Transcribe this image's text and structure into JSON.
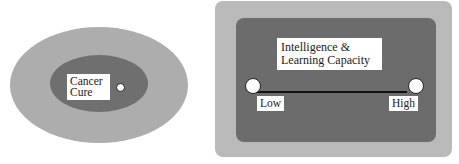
{
  "left_diagram": {
    "label": "Cancer Cure",
    "label_lines": [
      "Cancer",
      "Cure"
    ]
  },
  "right_diagram": {
    "title_lines": [
      "Intelligence &",
      "Learning Capacity"
    ],
    "scale": {
      "low_label": "Low",
      "high_label": "High"
    }
  },
  "colors": {
    "outer_light_gray": "#adadad",
    "inner_dark_gray": "#6f6f6f",
    "rect_outer": "#b9b9b9",
    "rect_inner": "#6c6c6c"
  }
}
